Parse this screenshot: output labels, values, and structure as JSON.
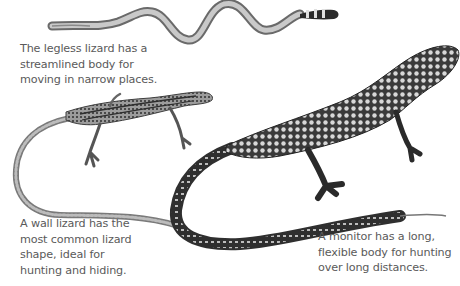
{
  "figure": {
    "background_color": "#ffffff",
    "text_color": "#5a5a5a",
    "illustrations": [
      {
        "name": "legless-lizard",
        "style": "grayscale engraving",
        "position": "top center"
      },
      {
        "name": "wall-lizard",
        "style": "grayscale engraving, striped",
        "position": "middle left"
      },
      {
        "name": "monitor-lizard",
        "style": "grayscale engraving, spotted",
        "position": "right, spanning center to bottom"
      }
    ],
    "captions": {
      "legless": "The legless lizard has a\nstreamlined body for\nmoving in narrow places.",
      "wall": "A wall lizard has the\nmost common lizard\nshape, ideal for\nhunting and hiding.",
      "monitor": "A monitor has a long,\nflexible body for hunting\nover long distances."
    }
  }
}
